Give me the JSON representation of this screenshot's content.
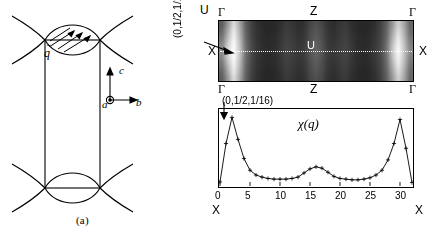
{
  "figure": {
    "panel_a_caption": "(a)",
    "panel_b_caption": "(b)",
    "panel_a": {
      "axes_triad": {
        "c_label": "c",
        "b_label": "b",
        "a_label": "a",
        "a_icon": "circled-dot-out-of-page-icon",
        "c_icon": "arrow-up-icon",
        "b_icon": "arrow-right-icon"
      },
      "q_vector_label": "q",
      "q_vector_accent": "→",
      "lens_top_icon": "lens-with-spin-arrows-icon",
      "lens_bottom_icon": "lens-icon",
      "chevron_icon": "chevron-arc-pair-icon"
    },
    "panel_b": {
      "map": {
        "top_left_label": "Γ",
        "top_center_label": "Z",
        "top_right_label": "Γ",
        "bottom_left_label": "Γ",
        "bottom_center_label": "Z",
        "bottom_right_label": "Γ",
        "left_label": "X",
        "right_label": "X",
        "center_label": "U",
        "cut_line_style": "dotted",
        "annotation_label": "(0,1/2,1/16)",
        "annotation_arrow_icon": "arrow-pointing-right-icon",
        "colormap": "grayscale"
      }
    }
  },
  "chart_data": [
    {
      "type": "heatmap",
      "title": "",
      "xlabel": "",
      "ylabel": "",
      "x_edge_labels": [
        "Γ",
        "Z",
        "Γ"
      ],
      "y_edge_labels": [
        "X",
        "U",
        "X"
      ],
      "annotation": "(0,1/2,1/16)",
      "colormap": "grayscale",
      "note": "Intensity map of chi(q); bright lobes near the left and right X points, dark interior with faint vertical banding.",
      "rows": 9,
      "cols": 33,
      "values": [
        [
          0.3,
          0.55,
          0.86,
          0.62,
          0.32,
          0.2,
          0.14,
          0.12,
          0.11,
          0.12,
          0.14,
          0.18,
          0.16,
          0.13,
          0.15,
          0.22,
          0.26,
          0.22,
          0.15,
          0.13,
          0.16,
          0.18,
          0.14,
          0.12,
          0.11,
          0.12,
          0.14,
          0.2,
          0.32,
          0.55,
          0.8,
          0.6,
          0.34
        ],
        [
          0.34,
          0.62,
          0.92,
          0.66,
          0.34,
          0.21,
          0.15,
          0.12,
          0.11,
          0.12,
          0.15,
          0.19,
          0.17,
          0.14,
          0.16,
          0.24,
          0.28,
          0.24,
          0.16,
          0.14,
          0.17,
          0.19,
          0.15,
          0.12,
          0.11,
          0.12,
          0.15,
          0.21,
          0.34,
          0.6,
          0.86,
          0.64,
          0.36
        ],
        [
          0.4,
          0.7,
          0.96,
          0.7,
          0.36,
          0.22,
          0.15,
          0.13,
          0.12,
          0.13,
          0.16,
          0.2,
          0.18,
          0.15,
          0.17,
          0.25,
          0.3,
          0.25,
          0.17,
          0.15,
          0.18,
          0.2,
          0.16,
          0.13,
          0.12,
          0.13,
          0.16,
          0.22,
          0.36,
          0.66,
          0.92,
          0.68,
          0.4
        ],
        [
          0.46,
          0.78,
          0.99,
          0.74,
          0.38,
          0.23,
          0.16,
          0.13,
          0.12,
          0.13,
          0.17,
          0.21,
          0.19,
          0.16,
          0.18,
          0.27,
          0.32,
          0.27,
          0.18,
          0.16,
          0.19,
          0.21,
          0.17,
          0.13,
          0.12,
          0.13,
          0.17,
          0.23,
          0.38,
          0.72,
          0.96,
          0.72,
          0.44
        ],
        [
          0.5,
          0.84,
          1.0,
          0.76,
          0.4,
          0.24,
          0.16,
          0.14,
          0.13,
          0.14,
          0.18,
          0.22,
          0.2,
          0.17,
          0.19,
          0.28,
          0.34,
          0.28,
          0.19,
          0.17,
          0.2,
          0.22,
          0.18,
          0.14,
          0.13,
          0.14,
          0.18,
          0.24,
          0.4,
          0.76,
          1.0,
          0.74,
          0.48
        ],
        [
          0.46,
          0.78,
          0.99,
          0.74,
          0.38,
          0.23,
          0.16,
          0.13,
          0.12,
          0.13,
          0.17,
          0.21,
          0.19,
          0.16,
          0.18,
          0.27,
          0.32,
          0.27,
          0.18,
          0.16,
          0.19,
          0.21,
          0.17,
          0.13,
          0.12,
          0.13,
          0.17,
          0.23,
          0.38,
          0.72,
          0.96,
          0.72,
          0.44
        ],
        [
          0.4,
          0.7,
          0.96,
          0.7,
          0.36,
          0.22,
          0.15,
          0.13,
          0.12,
          0.13,
          0.16,
          0.2,
          0.18,
          0.15,
          0.17,
          0.25,
          0.3,
          0.25,
          0.17,
          0.15,
          0.18,
          0.2,
          0.16,
          0.13,
          0.12,
          0.13,
          0.16,
          0.22,
          0.36,
          0.66,
          0.92,
          0.68,
          0.4
        ],
        [
          0.34,
          0.62,
          0.92,
          0.66,
          0.34,
          0.21,
          0.15,
          0.12,
          0.11,
          0.12,
          0.15,
          0.19,
          0.17,
          0.14,
          0.16,
          0.24,
          0.28,
          0.24,
          0.16,
          0.14,
          0.17,
          0.19,
          0.15,
          0.12,
          0.11,
          0.12,
          0.15,
          0.21,
          0.34,
          0.6,
          0.86,
          0.64,
          0.36
        ],
        [
          0.3,
          0.55,
          0.86,
          0.62,
          0.32,
          0.2,
          0.14,
          0.12,
          0.11,
          0.12,
          0.14,
          0.18,
          0.16,
          0.13,
          0.15,
          0.22,
          0.26,
          0.22,
          0.15,
          0.13,
          0.16,
          0.18,
          0.14,
          0.12,
          0.11,
          0.12,
          0.14,
          0.2,
          0.32,
          0.55,
          0.8,
          0.6,
          0.34
        ]
      ]
    },
    {
      "type": "line",
      "title": "χ(q)",
      "xlabel": "U",
      "ylabel": "",
      "x_left_endlabel": "X",
      "x_right_endlabel": "X",
      "xlim": [
        0,
        32
      ],
      "ylim": [
        0,
        1.05
      ],
      "xticks": [
        0,
        5,
        10,
        15,
        20,
        25,
        30
      ],
      "xticklabels": [
        "0",
        "5",
        "10",
        "15",
        "20",
        "25",
        "30"
      ],
      "grid": false,
      "legend": null,
      "marker": "plus",
      "annotation": "(0,1/2,1/16)",
      "annotation_arrow_icon": "arrow-down-icon",
      "x": [
        0,
        1,
        2,
        3,
        4,
        5,
        6,
        7,
        8,
        9,
        10,
        11,
        12,
        13,
        14,
        15,
        16,
        17,
        18,
        19,
        20,
        21,
        22,
        23,
        24,
        25,
        26,
        27,
        28,
        29,
        30,
        31,
        32
      ],
      "values": [
        0.06,
        0.62,
        1.0,
        0.68,
        0.4,
        0.23,
        0.16,
        0.13,
        0.11,
        0.1,
        0.1,
        0.1,
        0.11,
        0.13,
        0.19,
        0.25,
        0.28,
        0.26,
        0.2,
        0.14,
        0.11,
        0.1,
        0.09,
        0.09,
        0.1,
        0.12,
        0.16,
        0.23,
        0.38,
        0.62,
        0.97,
        0.55,
        0.05
      ]
    }
  ]
}
